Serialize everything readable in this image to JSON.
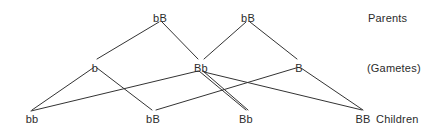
{
  "diagram": {
    "background_color": "#ffffff",
    "line_color": "#333333",
    "text_color": "#2b2b2b",
    "row_labels": [
      {
        "id": "row-parents",
        "text": "Parents",
        "x": 368,
        "y": 12
      },
      {
        "id": "row-gametes",
        "text": "(Gametes)",
        "x": 367,
        "y": 62
      },
      {
        "id": "row-children",
        "text": "Children",
        "x": 376,
        "y": 113
      }
    ],
    "nodes": [
      {
        "id": "parent-1",
        "label": "bB",
        "x": 160,
        "y": 12,
        "row": "parents"
      },
      {
        "id": "parent-2",
        "label": "bB",
        "x": 248,
        "y": 12,
        "row": "parents"
      },
      {
        "id": "gamete-b",
        "label": "b",
        "x": 95,
        "y": 62,
        "row": "gametes"
      },
      {
        "id": "gamete-Bb",
        "label": "Bb",
        "x": 201,
        "y": 62,
        "row": "gametes"
      },
      {
        "id": "gamete-B",
        "label": "B",
        "x": 299,
        "y": 62,
        "row": "gametes"
      },
      {
        "id": "child-bb",
        "label": "bb",
        "x": 32,
        "y": 113,
        "row": "children"
      },
      {
        "id": "child-bB",
        "label": "bB",
        "x": 153,
        "y": 113,
        "row": "children"
      },
      {
        "id": "child-Bb",
        "label": "Bb",
        "x": 246,
        "y": 113,
        "row": "children"
      },
      {
        "id": "child-BB",
        "label": "BB",
        "x": 363,
        "y": 113,
        "row": "children"
      }
    ],
    "edges": [
      {
        "id": "edge-p1-b",
        "from": "parent-1",
        "to": "gamete-b",
        "x1": 159,
        "y1": 22,
        "x2": 97,
        "y2": 59
      },
      {
        "id": "edge-p1-Bb",
        "from": "parent-1",
        "to": "gamete-Bb",
        "x1": 162,
        "y1": 22,
        "x2": 198,
        "y2": 59
      },
      {
        "id": "edge-p2-Bb",
        "from": "parent-2",
        "to": "gamete-Bb",
        "x1": 246,
        "y1": 22,
        "x2": 204,
        "y2": 59
      },
      {
        "id": "edge-p2-B",
        "from": "parent-2",
        "to": "gamete-B",
        "x1": 250,
        "y1": 22,
        "x2": 297,
        "y2": 59
      },
      {
        "id": "edge-b-bb",
        "from": "gamete-b",
        "to": "child-bb",
        "x1": 93,
        "y1": 68,
        "x2": 32,
        "y2": 110
      },
      {
        "id": "edge-b-bB",
        "from": "gamete-b",
        "to": "child-bB",
        "x1": 97,
        "y1": 68,
        "x2": 152,
        "y2": 110
      },
      {
        "id": "edge-Bb-bb",
        "from": "gamete-Bb",
        "to": "child-bb",
        "x1": 198,
        "y1": 71,
        "x2": 31,
        "y2": 111
      },
      {
        "id": "edge-Bb-Bb-a",
        "from": "gamete-Bb",
        "to": "child-Bb",
        "x1": 199,
        "y1": 71,
        "x2": 246,
        "y2": 110
      },
      {
        "id": "edge-Bb-Bb-b",
        "from": "gamete-Bb",
        "to": "child-Bb",
        "x1": 203,
        "y1": 71,
        "x2": 248,
        "y2": 110
      },
      {
        "id": "edge-Bb-BB",
        "from": "gamete-Bb",
        "to": "child-BB",
        "x1": 204,
        "y1": 72,
        "x2": 362,
        "y2": 110
      },
      {
        "id": "edge-B-bB",
        "from": "gamete-B",
        "to": "child-bB",
        "x1": 296,
        "y1": 68,
        "x2": 156,
        "y2": 110
      },
      {
        "id": "edge-B-BB",
        "from": "gamete-B",
        "to": "child-BB",
        "x1": 301,
        "y1": 68,
        "x2": 363,
        "y2": 110
      }
    ]
  }
}
